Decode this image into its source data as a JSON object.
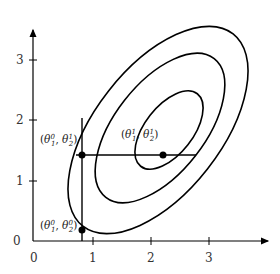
{
  "diagram": {
    "type": "contour-coordinate-descent",
    "axes": {
      "x_ticks": [
        "0",
        "1",
        "2",
        "3"
      ],
      "y_ticks": [
        "0",
        "1",
        "2",
        "3"
      ]
    },
    "points": [
      {
        "id": "p0",
        "label": "(θ₁⁰, θ₂⁰)",
        "base1": "θ",
        "sub1": "1",
        "sup1": "0",
        "base2": "θ",
        "sub2": "2",
        "sup2": "0",
        "x": 0.8,
        "y": 0.2
      },
      {
        "id": "p1",
        "label": "(θ₁⁰, θ₂¹)",
        "base1": "θ",
        "sub1": "1",
        "sup1": "0",
        "base2": "θ",
        "sub2": "2",
        "sup2": "1",
        "x": 0.8,
        "y": 1.45
      },
      {
        "id": "p2",
        "label": "(θ₁¹, θ₂¹)",
        "base1": "θ",
        "sub1": "1",
        "sup1": "1",
        "base2": "θ",
        "sub2": "2",
        "sup2": "1",
        "x": 1.7,
        "y": 1.45
      }
    ],
    "contours": 3,
    "colors": {
      "stroke": "#000000",
      "text": "#333333",
      "background": "#ffffff"
    }
  }
}
